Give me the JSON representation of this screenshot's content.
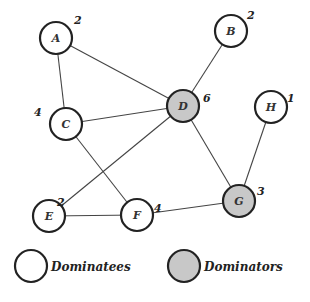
{
  "graph": {
    "nodes": [
      {
        "id": "A",
        "label": "A",
        "degree": "2",
        "type": "dominatee",
        "x": 56,
        "y": 38
      },
      {
        "id": "B",
        "label": "B",
        "degree": "2",
        "type": "dominatee",
        "x": 231,
        "y": 31
      },
      {
        "id": "C",
        "label": "C",
        "degree": "4",
        "type": "dominatee",
        "x": 66,
        "y": 124
      },
      {
        "id": "D",
        "label": "D",
        "degree": "6",
        "type": "dominator",
        "x": 183,
        "y": 106
      },
      {
        "id": "H",
        "label": "H",
        "degree": "1",
        "type": "dominatee",
        "x": 271,
        "y": 107
      },
      {
        "id": "E",
        "label": "E",
        "degree": "2",
        "type": "dominatee",
        "x": 49,
        "y": 216
      },
      {
        "id": "F",
        "label": "F",
        "degree": "4",
        "type": "dominatee",
        "x": 137,
        "y": 215
      },
      {
        "id": "G",
        "label": "G",
        "degree": "3",
        "type": "dominator",
        "x": 239,
        "y": 201
      }
    ],
    "edges": [
      [
        "A",
        "C"
      ],
      [
        "A",
        "D"
      ],
      [
        "B",
        "D"
      ],
      [
        "C",
        "D"
      ],
      [
        "C",
        "F"
      ],
      [
        "D",
        "E"
      ],
      [
        "D",
        "G"
      ],
      [
        "E",
        "F"
      ],
      [
        "F",
        "G"
      ],
      [
        "H",
        "G"
      ]
    ]
  },
  "legend": {
    "dominatees": "Dominatees",
    "dominators": "Dominators"
  },
  "colors": {
    "dominator_fill": "#c8c8c8",
    "dominatee_fill": "#ffffff",
    "stroke": "#222222",
    "edge": "#444444"
  }
}
